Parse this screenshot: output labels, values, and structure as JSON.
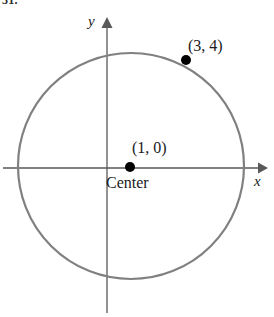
{
  "figure": {
    "problem_number": "31.",
    "axes": {
      "x_label": "x",
      "y_label": "y",
      "x_arrow_icon": "arrow-right-icon",
      "y_arrow_icon": "arrow-up-icon",
      "axis_color": "#595959"
    },
    "circle": {
      "stroke_color": "#808080",
      "center_x_px": 131,
      "center_y_px": 166,
      "radius_px": 113,
      "stroke_width_px": 2.2
    },
    "points": [
      {
        "name": "center-point",
        "label": "(1, 0)",
        "caption": "Center",
        "coordinates": [
          1,
          0
        ],
        "px": [
          130,
          167
        ],
        "dot_color": "#000000",
        "dot_radius_px": 5
      },
      {
        "name": "circle-point",
        "label": "(3, 4)",
        "caption": "",
        "coordinates": [
          3,
          4
        ],
        "px": [
          186,
          60
        ],
        "dot_color": "#000000",
        "dot_radius_px": 5
      }
    ]
  },
  "chart_data": {
    "type": "scatter",
    "title": "",
    "subtitle": "",
    "xlabel": "x",
    "ylabel": "y",
    "grid": false,
    "legend": "none",
    "shapes": [
      {
        "kind": "circle",
        "center": [
          1,
          0
        ],
        "radius": 4.47,
        "label": "",
        "color": "#808080"
      }
    ],
    "points": [
      {
        "x": 1,
        "y": 0,
        "label": "(1, 0)",
        "annotation": "Center"
      },
      {
        "x": 3,
        "y": 4,
        "label": "(3, 4)",
        "annotation": ""
      }
    ],
    "xlim": [
      -3.4,
      6.1
    ],
    "ylim": [
      -5.2,
      5.5
    ]
  }
}
